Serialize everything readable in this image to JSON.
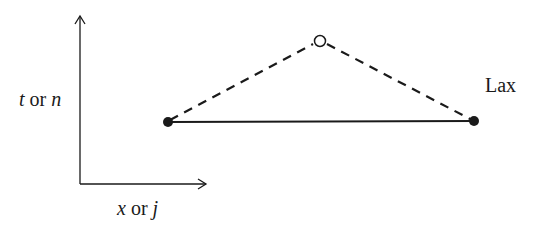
{
  "diagram": {
    "type": "finite-difference-stencil",
    "scheme_label": "Lax",
    "axes": {
      "vertical": {
        "var": "t",
        "connector": " or ",
        "index": "n"
      },
      "horizontal": {
        "var": "x",
        "connector": " or ",
        "index": "j"
      }
    },
    "nodes": [
      {
        "id": "left",
        "role": "known point (j-1, n)",
        "style": "filled"
      },
      {
        "id": "top",
        "role": "new point (j, n+1)",
        "style": "open"
      },
      {
        "id": "right",
        "role": "known point (j+1, n)",
        "style": "filled"
      }
    ],
    "edges": [
      {
        "from": "left",
        "to": "right",
        "style": "solid"
      },
      {
        "from": "left",
        "to": "top",
        "style": "dashed"
      },
      {
        "from": "top",
        "to": "right",
        "style": "dashed"
      }
    ],
    "colors": {
      "ink": "#1a1a1a",
      "background": "#ffffff"
    }
  }
}
